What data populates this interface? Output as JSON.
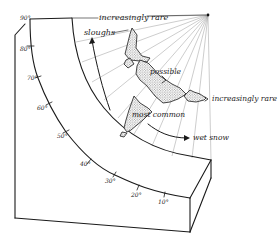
{
  "diagram": {
    "labels": {
      "top_rare": "increasingly rare",
      "right_rare": "increasingly rare",
      "sloughs": "sloughs",
      "possible": "possible",
      "most_common": "most common",
      "wet_snow": "wet snow"
    },
    "slope_angle_ticks": [
      "90°",
      "80°",
      "70°",
      "60°",
      "50°",
      "40°",
      "30°",
      "20°",
      "10°"
    ],
    "colors": {
      "ink": "#1a1a1a",
      "ray": "#9a9a9a",
      "background": "#ffffff"
    }
  }
}
